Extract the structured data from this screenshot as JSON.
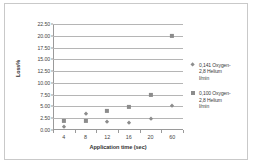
{
  "chart_data": {
    "type": "scatter",
    "title": "",
    "xlabel": "Application time (sec)",
    "ylabel": "Loss%",
    "categories": [
      "4",
      "8",
      "12",
      "16",
      "20",
      "60"
    ],
    "ylim": [
      0,
      22.5
    ],
    "ytick_labels": [
      "0.00",
      "2.50",
      "5.00",
      "7.50",
      "10.00",
      "12.50",
      "15.00",
      "17.50",
      "20.00",
      "22.50"
    ],
    "ytick_values": [
      0,
      2.5,
      5,
      7.5,
      10,
      12.5,
      15,
      17.5,
      20,
      22.5
    ],
    "grid": "horizontal",
    "legend_position": "right",
    "series": [
      {
        "name": "0,141 Oxygen-2.8  Helium l/min",
        "marker": "diamond",
        "color": "#8c8c8c",
        "values": [
          0.6,
          3.5,
          1.7,
          1.45,
          2.35,
          5.2
        ]
      },
      {
        "name": "0,100 Oxygen-2.8  Helium l/min",
        "marker": "square",
        "color": "#8c8c8c",
        "values": [
          2.0,
          1.9,
          4.0,
          4.9,
          7.5,
          20.0
        ]
      }
    ]
  },
  "legend": {
    "entries": [
      {
        "marker": "diamond",
        "line1": "0,141 Oxygen-",
        "line2": "2,8  Helium",
        "line3": "l/min"
      },
      {
        "marker": "square",
        "line1": "0,100 Oxygen-",
        "line2": "2,8  Helium",
        "line3": "l/min"
      }
    ]
  }
}
